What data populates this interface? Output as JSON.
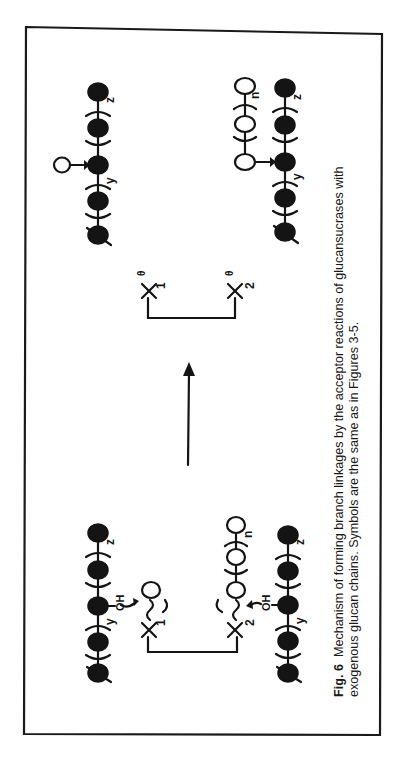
{
  "figure": {
    "label": "Fig. 6",
    "caption_line1": "Mechanism of forming branch linkages by the acceptor reactions of glucansucrases with",
    "caption_line2": "exogenous glucan chains.  Symbols are the same as in Figures 3-5.",
    "orientation": "rotated 90° counter-clockwise"
  },
  "legend_symbols": {
    "filled_circle": "glucose residue of acceptor glucan chain",
    "open_circle": "glucose residue transferred from enzyme",
    "arc_pair": "repeating unit bracket"
  },
  "reactants": {
    "enzyme_nucleophiles": [
      {
        "symbol": "X",
        "subscript": "1"
      },
      {
        "symbol": "X",
        "subscript": "2"
      }
    ],
    "acceptor_group": "OH",
    "chain_subscripts": [
      "y",
      "z",
      "n"
    ]
  },
  "products": {
    "enzyme_nucleophiles": [
      {
        "symbol": "X",
        "subscript": "1",
        "charge": "θ"
      },
      {
        "symbol": "X",
        "subscript": "2",
        "charge": "θ"
      }
    ],
    "chain_subscripts": [
      "y",
      "z",
      "n"
    ]
  },
  "colors": {
    "ink": "#141414",
    "background": "#ffffff"
  }
}
